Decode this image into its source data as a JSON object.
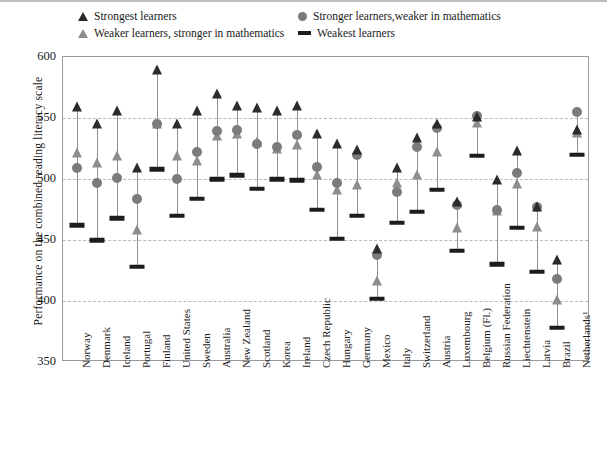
{
  "chart_data": {
    "type": "scatter",
    "title": "",
    "xlabel": "",
    "ylabel": "Performance on the combined reading literacy scale",
    "ylim": [
      350,
      600
    ],
    "yticks": [
      350,
      400,
      450,
      500,
      550,
      600
    ],
    "grid": true,
    "legend_position": "top",
    "series": [
      {
        "name": "Strongest learners",
        "marker": "triangle",
        "color": "#2b2b2b"
      },
      {
        "name": "Stronger learners,weaker in mathematics",
        "marker": "circle",
        "color": "#7b7b7b"
      },
      {
        "name": "Weaker learners, stronger in mathematics",
        "marker": "triangle",
        "color": "#8d8d8d"
      },
      {
        "name": "Weakest learners",
        "marker": "dash",
        "color": "#1c1c1c"
      }
    ],
    "categories": [
      "Norway",
      "Denmark",
      "Iceland",
      "Portugal",
      "Finland",
      "United States",
      "Sweden",
      "Australia",
      "New Zealand",
      "Scotland",
      "Korea",
      "Ireland",
      "Czech Republic",
      "Hungary",
      "Germany",
      "Mexico",
      "Italy",
      "Switzerland",
      "Austria",
      "Luxembourg",
      "Belgium (Fl.)",
      "Russian Federation",
      "Liechtenstein",
      "Latvia",
      "Brazil",
      "Netherlands¹"
    ],
    "points": [
      {
        "category": "Norway",
        "strongest": 559,
        "stronger_weaker_math": 509,
        "weaker_stronger_math": 521,
        "weakest": 462
      },
      {
        "category": "Denmark",
        "strongest": 545,
        "stronger_weaker_math": 497,
        "weaker_stronger_math": 513,
        "weakest": 450
      },
      {
        "category": "Iceland",
        "strongest": 556,
        "stronger_weaker_math": 501,
        "weaker_stronger_math": 519,
        "weakest": 468
      },
      {
        "category": "Portugal",
        "strongest": 509,
        "stronger_weaker_math": 484,
        "weaker_stronger_math": 458,
        "weakest": 428
      },
      {
        "category": "Finland",
        "strongest": 589,
        "stronger_weaker_math": 545,
        "weaker_stronger_math": 545,
        "weakest": 508
      },
      {
        "category": "United States",
        "strongest": 545,
        "stronger_weaker_math": 500,
        "weaker_stronger_math": 519,
        "weakest": 470
      },
      {
        "category": "Sweden",
        "strongest": 556,
        "stronger_weaker_math": 522,
        "weaker_stronger_math": 515,
        "weakest": 484
      },
      {
        "category": "Australia",
        "strongest": 570,
        "stronger_weaker_math": 539,
        "weaker_stronger_math": 535,
        "weakest": 500
      },
      {
        "category": "New Zealand",
        "strongest": 560,
        "stronger_weaker_math": 540,
        "weaker_stronger_math": 537,
        "weakest": 503
      },
      {
        "category": "Scotland",
        "strongest": 558,
        "stronger_weaker_math": 529,
        "weaker_stronger_math": 530,
        "weakest": 492
      },
      {
        "category": "Korea",
        "strongest": 556,
        "stronger_weaker_math": 526,
        "weaker_stronger_math": 525,
        "weakest": 500
      },
      {
        "category": "Ireland",
        "strongest": 560,
        "stronger_weaker_math": 536,
        "weaker_stronger_math": 528,
        "weakest": 499
      },
      {
        "category": "Czech Republic",
        "strongest": 537,
        "stronger_weaker_math": 510,
        "weaker_stronger_math": 503,
        "weakest": 475
      },
      {
        "category": "Hungary",
        "strongest": 529,
        "stronger_weaker_math": 497,
        "weaker_stronger_math": 491,
        "weakest": 451
      },
      {
        "category": "Germany",
        "strongest": 524,
        "stronger_weaker_math": 520,
        "weaker_stronger_math": 495,
        "weakest": 470
      },
      {
        "category": "Mexico",
        "strongest": 443,
        "stronger_weaker_math": 438,
        "weaker_stronger_math": 416,
        "weakest": 402
      },
      {
        "category": "Italy",
        "strongest": 509,
        "stronger_weaker_math": 489,
        "weaker_stronger_math": 497,
        "weakest": 464
      },
      {
        "category": "Switzerland",
        "strongest": 534,
        "stronger_weaker_math": 526,
        "weaker_stronger_math": 503,
        "weakest": 473
      },
      {
        "category": "Austria",
        "strongest": 545,
        "stronger_weaker_math": 542,
        "weaker_stronger_math": 522,
        "weakest": 491
      },
      {
        "category": "Luxembourg",
        "strongest": 481,
        "stronger_weaker_math": 479,
        "weaker_stronger_math": 460,
        "weakest": 441
      },
      {
        "category": "Belgium (Fl.)",
        "strongest": 551,
        "stronger_weaker_math": 552,
        "weaker_stronger_math": 546,
        "weakest": 519
      },
      {
        "category": "Russian Federation",
        "strongest": 499,
        "stronger_weaker_math": 475,
        "weaker_stronger_math": 474,
        "weakest": 430
      },
      {
        "category": "Liechtenstein",
        "strongest": 523,
        "stronger_weaker_math": 505,
        "weaker_stronger_math": 496,
        "weakest": 460
      },
      {
        "category": "Latvia",
        "strongest": 477,
        "stronger_weaker_math": 477,
        "weaker_stronger_math": 461,
        "weakest": 424
      },
      {
        "category": "Brazil",
        "strongest": 434,
        "stronger_weaker_math": 418,
        "weaker_stronger_math": 401,
        "weakest": 378
      },
      {
        "category": "Netherlands¹",
        "strongest": 540,
        "stronger_weaker_math": 555,
        "weaker_stronger_math": 538,
        "weakest": 520
      }
    ]
  },
  "legend": {
    "strongest": "Strongest learners",
    "stronger_weaker_math": "Stronger learners,weaker in mathematics",
    "weaker_stronger_math": "Weaker learners, stronger in mathematics",
    "weakest": "Weakest learners"
  },
  "axis": {
    "ylabel": "Performance on the combined reading literacy scale"
  }
}
